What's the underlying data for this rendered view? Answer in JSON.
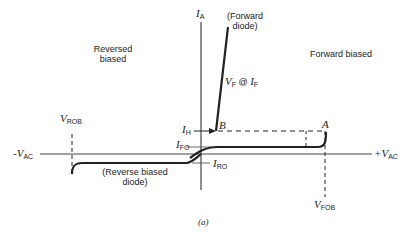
{
  "figure": {
    "caption": "(a)",
    "regions": {
      "reversed_line1": "Reversed",
      "reversed_line2": "biased",
      "forward": "Forward biased"
    },
    "axes": {
      "y_label_main": "I",
      "y_label_sub": "A",
      "x_neg_prefix": "-V",
      "x_neg_sub": "AC",
      "x_pos_prefix": "+V",
      "x_pos_sub": "AC"
    },
    "annotations": {
      "forward_diode_line1": "(Forward",
      "forward_diode_line2": "diode)",
      "vf_main": "V",
      "vf_sub": "F",
      "vf_at": " @ ",
      "if_main": "I",
      "if_sub": "F",
      "ih_main": "I",
      "ih_sub": "H",
      "ifo_main": "I",
      "ifo_sub": "FO",
      "iro_main": "I",
      "iro_sub": "RO",
      "point_a": "A",
      "point_b": "B",
      "vrob_main": "V",
      "vrob_sub": "ROB",
      "vfob_main": "V",
      "vfob_sub": "FOB",
      "reverse_diode_line1": "(Reverse biased",
      "reverse_diode_line2": "diode)"
    },
    "colors": {
      "line": "#222222",
      "axis": "#444444"
    }
  }
}
